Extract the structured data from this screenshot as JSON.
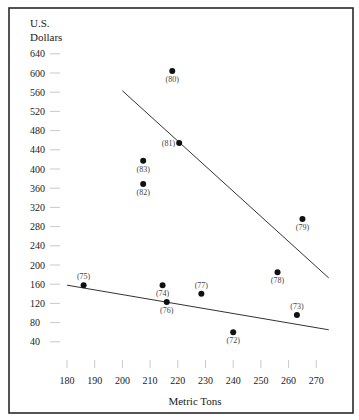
{
  "chart_data": {
    "type": "scatter",
    "title": "",
    "xlabel": "Metric Tons",
    "ylabel": [
      "U.S.",
      "Dollars"
    ],
    "xlim": [
      180,
      270
    ],
    "ylim": [
      40,
      640
    ],
    "x_ticks": [
      180,
      190,
      200,
      210,
      220,
      230,
      240,
      250,
      260,
      270
    ],
    "y_ticks": [
      640,
      600,
      560,
      520,
      480,
      440,
      400,
      360,
      320,
      280,
      240,
      200,
      160,
      120,
      80,
      40
    ],
    "grid": false,
    "legend": null,
    "points": [
      {
        "label": "(72)",
        "x": 240,
        "y": 60,
        "label_pos": "below"
      },
      {
        "label": "(73)",
        "x": 263,
        "y": 96,
        "label_pos": "above"
      },
      {
        "label": "(74)",
        "x": 214.5,
        "y": 158,
        "label_pos": "below"
      },
      {
        "label": "(75)",
        "x": 186,
        "y": 158,
        "label_pos": "above"
      },
      {
        "label": "(76)",
        "x": 216,
        "y": 123,
        "label_pos": "below"
      },
      {
        "label": "(77)",
        "x": 228.5,
        "y": 140,
        "label_pos": "above"
      },
      {
        "label": "(78)",
        "x": 256,
        "y": 185,
        "label_pos": "below"
      },
      {
        "label": "(79)",
        "x": 265,
        "y": 296,
        "label_pos": "below"
      },
      {
        "label": "(80)",
        "x": 218,
        "y": 604,
        "label_pos": "below"
      },
      {
        "label": "(81)",
        "x": 220.5,
        "y": 454,
        "label_pos": "left"
      },
      {
        "label": "(82)",
        "x": 207.5,
        "y": 369,
        "label_pos": "below"
      },
      {
        "label": "(83)",
        "x": 207.5,
        "y": 417,
        "label_pos": "below"
      }
    ],
    "trend_lines": [
      {
        "name": "upper trend",
        "x": [
          200,
          274.5
        ],
        "y": [
          563,
          173
        ]
      },
      {
        "name": "lower trend",
        "x": [
          180,
          274.5
        ],
        "y": [
          158,
          65
        ]
      }
    ]
  }
}
